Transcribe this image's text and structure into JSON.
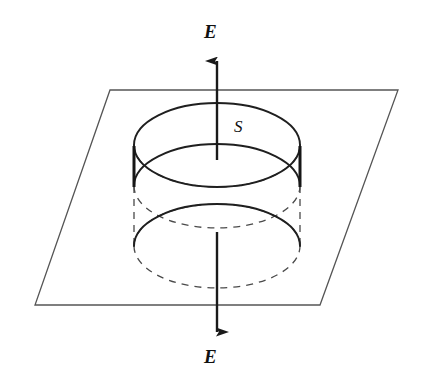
{
  "figure": {
    "kind": "physics-diagram",
    "background_color": "#ffffff",
    "stroke_color": "#2b2b2b",
    "heavy_stroke_color": "#1a1a1a",
    "plane_stroke_color": "#555555"
  },
  "labels": {
    "field_top": "E",
    "field_bottom": "E",
    "surface": "S"
  },
  "geometry": {
    "center_x": 217,
    "plane": {
      "top_left": [
        110,
        90
      ],
      "top_right": [
        398,
        90
      ],
      "bottom_right": [
        320,
        305
      ],
      "bottom_left": [
        35,
        305
      ]
    },
    "cylinder": {
      "radius_x": 83,
      "radius_y": 42,
      "top_ellipse_cy": 145,
      "mid_ellipse_cy": 186,
      "bottom_ellipse_cy": 246,
      "left_x": 134,
      "right_x": 300
    },
    "arrow_up": {
      "tail_y": 160,
      "head_y": 61
    },
    "arrow_down": {
      "tail_y": 232,
      "head_y": 332
    }
  }
}
